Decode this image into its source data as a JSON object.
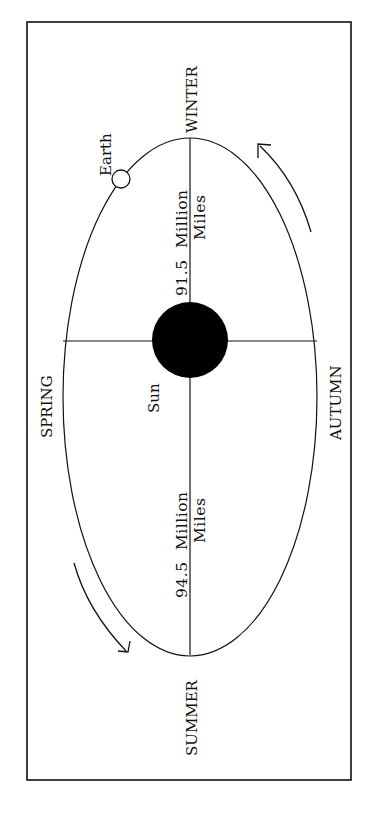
{
  "diagram": {
    "colors": {
      "line": "#111111",
      "background": "#ffffff",
      "sun": "#000000"
    },
    "seasons": {
      "winter": "WINTER",
      "spring": "SPRING",
      "summer": "SUMMER",
      "autumn": "AUTUMN"
    },
    "bodies": {
      "earth": "Earth",
      "sun": "Sun"
    },
    "distances": {
      "near": {
        "value": "91.5",
        "unit_line1": "Million",
        "unit_line2": "Miles"
      },
      "far": {
        "value": "94.5",
        "unit_line1": "Million",
        "unit_line2": "Miles"
      }
    },
    "arrows": [
      {
        "name": "orbit-direction-arrow-top-right",
        "direction": "counterclockwise"
      },
      {
        "name": "orbit-direction-arrow-bottom-left",
        "direction": "counterclockwise"
      }
    ]
  }
}
